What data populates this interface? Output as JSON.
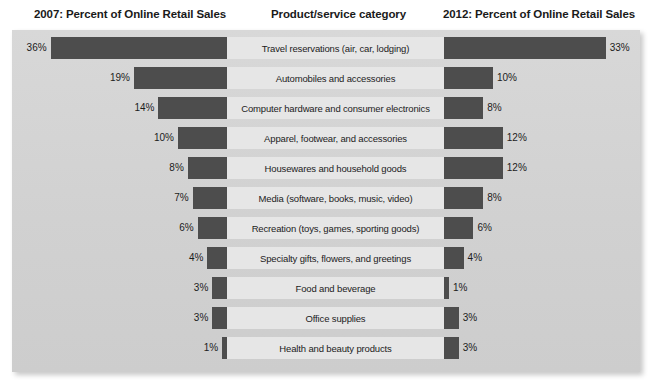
{
  "header": {
    "left": "2007: Percent of Online Retail Sales",
    "middle": "Product/service category",
    "right": "2012: Percent of Online Retail Sales"
  },
  "chart_data": {
    "type": "bar",
    "subtype": "tornado",
    "title": "",
    "xlabel": "",
    "ylabel": "",
    "categories": [
      "Travel reservations (air, car, lodging)",
      "Automobiles and accessories",
      "Computer hardware and consumer electronics",
      "Apparel, footwear, and accessories",
      "Housewares and household goods",
      "Media (software, books, music, video)",
      "Recreation (toys, games, sporting goods)",
      "Specialty gifts, flowers, and greetings",
      "Food and beverage",
      "Office supplies",
      "Health and beauty products"
    ],
    "series": [
      {
        "name": "2007: Percent of Online Retail Sales",
        "values": [
          36,
          19,
          14,
          10,
          8,
          7,
          6,
          4,
          3,
          3,
          1
        ],
        "labels": [
          "36%",
          "19%",
          "14%",
          "10%",
          "8%",
          "7%",
          "6%",
          "4%",
          "3%",
          "3%",
          "1%"
        ],
        "side": "left"
      },
      {
        "name": "2012: Percent of Online Retail Sales",
        "values": [
          33,
          10,
          8,
          12,
          12,
          8,
          6,
          4,
          1,
          3,
          3
        ],
        "labels": [
          "33%",
          "10%",
          "8%",
          "12%",
          "12%",
          "8%",
          "6%",
          "4%",
          "1%",
          "3%",
          "3%"
        ],
        "side": "right"
      }
    ],
    "xlim": [
      0,
      36
    ],
    "grid": false,
    "legend": "none",
    "units": "percent"
  },
  "colors": {
    "bar": "#4d4d4d",
    "panel_background": "#d3d3d3",
    "label_strip": "#e6e6e6",
    "text": "#1c1c1c"
  }
}
